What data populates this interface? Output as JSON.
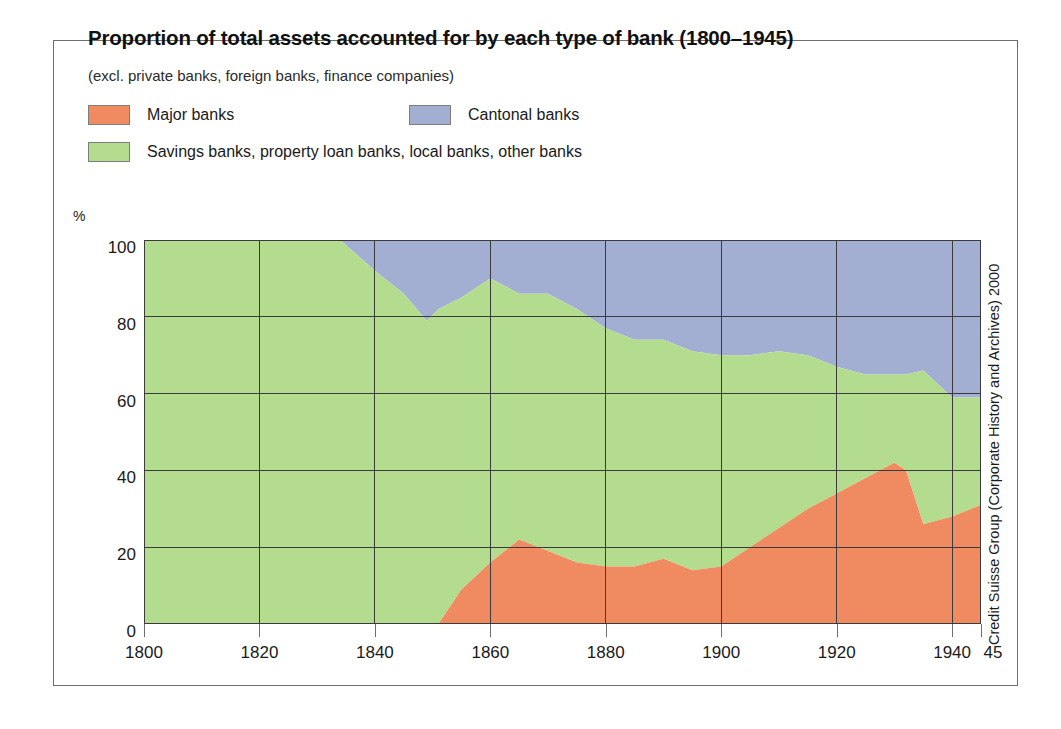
{
  "header": {
    "title": "Proportion of total assets accounted for by each type of bank (1800–1945)",
    "subtitle": "(excl. private banks, foreign banks, finance companies)"
  },
  "legend": {
    "items": [
      {
        "label": "Major banks",
        "color": "#F08A60"
      },
      {
        "label": "Cantonal banks",
        "color": "#A3AFD2"
      },
      {
        "label": "Savings banks, property loan banks, local banks, other banks",
        "color": "#B4DC8E"
      }
    ]
  },
  "axes": {
    "y_unit": "%",
    "y_ticks": [
      "0",
      "20",
      "40",
      "60",
      "80",
      "100"
    ],
    "x_ticks": [
      "1800",
      "1820",
      "1840",
      "1860",
      "1880",
      "1900",
      "1920",
      "1940"
    ],
    "x_end_label": "45"
  },
  "credit": "Credit Suisse Group (Corporate History and Archives) 2000",
  "chart_data": {
    "type": "area",
    "stacked": true,
    "title": "Proportion of total assets accounted for by each type of bank (1800–1945)",
    "subtitle": "(excl. private banks, foreign banks, finance companies)",
    "xlabel": "",
    "ylabel": "%",
    "xlim": [
      1800,
      1945
    ],
    "ylim": [
      0,
      100
    ],
    "grid": true,
    "legend_position": "top",
    "x_ticks": [
      1800,
      1820,
      1840,
      1860,
      1880,
      1900,
      1920,
      1940
    ],
    "y_ticks": [
      0,
      20,
      40,
      60,
      80,
      100
    ],
    "x": [
      1800,
      1810,
      1820,
      1830,
      1834,
      1840,
      1845,
      1849,
      1851,
      1855,
      1860,
      1865,
      1870,
      1875,
      1880,
      1885,
      1890,
      1895,
      1900,
      1905,
      1910,
      1915,
      1920,
      1925,
      1930,
      1932,
      1935,
      1940,
      1945
    ],
    "series": [
      {
        "name": "Major banks",
        "color": "#F08A60",
        "values": [
          0,
          0,
          0,
          0,
          0,
          0,
          0,
          0,
          0,
          9,
          16,
          22,
          19,
          16,
          15,
          15,
          17,
          14,
          15,
          20,
          25,
          30,
          34,
          38,
          42,
          40,
          26,
          28,
          31
        ]
      },
      {
        "name": "Savings banks, property loan banks, local banks, other banks",
        "color": "#B4DC8E",
        "values": [
          100,
          100,
          100,
          100,
          100,
          92,
          86,
          79,
          82,
          76,
          74,
          64,
          67,
          66,
          62,
          59,
          57,
          57,
          55,
          50,
          46,
          40,
          33,
          27,
          23,
          25,
          40,
          31,
          28
        ]
      },
      {
        "name": "Cantonal banks",
        "color": "#A3AFD2",
        "values": [
          0,
          0,
          0,
          0,
          0,
          8,
          14,
          21,
          18,
          15,
          10,
          14,
          14,
          18,
          23,
          26,
          26,
          29,
          30,
          30,
          29,
          30,
          33,
          35,
          35,
          35,
          34,
          41,
          41
        ]
      }
    ],
    "cumulative_top_boundaries": {
      "major_banks_top": [
        0,
        0,
        0,
        0,
        0,
        0,
        0,
        0,
        0,
        9,
        16,
        22,
        19,
        16,
        15,
        15,
        17,
        14,
        15,
        20,
        25,
        30,
        34,
        38,
        42,
        40,
        26,
        28,
        31
      ],
      "savings_banks_top": [
        100,
        100,
        100,
        100,
        100,
        92,
        86,
        79,
        82,
        85,
        90,
        86,
        86,
        82,
        77,
        74,
        74,
        71,
        70,
        70,
        71,
        70,
        67,
        65,
        65,
        65,
        66,
        59,
        59
      ]
    }
  }
}
